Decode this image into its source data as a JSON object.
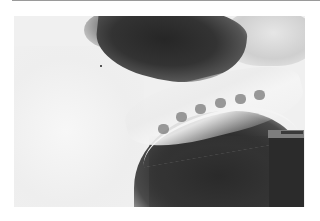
{
  "image": {
    "kind": "radiograph",
    "subject": "lateral x-ray of thoracic spine region",
    "palette": {
      "background": "#ffffff",
      "film_light": "#f0f0f0",
      "film_dark": "#262626",
      "rule": "#9a9a9a"
    }
  }
}
